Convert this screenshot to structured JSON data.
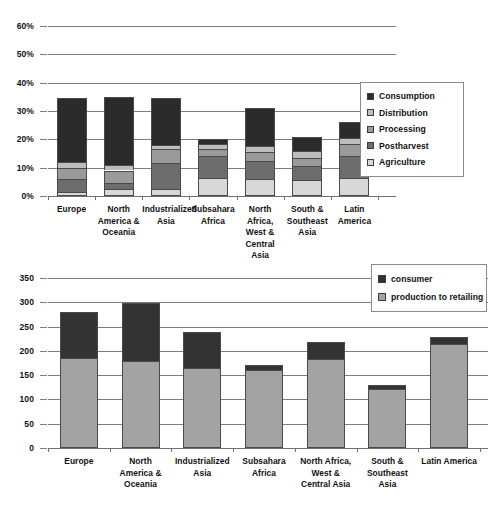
{
  "chart_data": [
    {
      "type": "bar",
      "stacked": true,
      "title": "",
      "xlabel": "",
      "ylabel": "",
      "ylim": [
        0,
        60
      ],
      "ytick_labels": [
        "0%",
        "10%",
        "20%",
        "30%",
        "40%",
        "50%",
        "60%"
      ],
      "ytick_values": [
        0,
        10,
        20,
        30,
        40,
        50,
        60
      ],
      "grid": true,
      "legend_position": "right",
      "categories": [
        "Europe",
        "North America & Oceania",
        "Industrialized Asia",
        "Subsahara Africa",
        "North Africa, West & Central Asia",
        "South & Southeast Asia",
        "Latin America"
      ],
      "category_lines": [
        [
          "Europe"
        ],
        [
          "North",
          "America &",
          "Oceania"
        ],
        [
          "Industrialized",
          "Asia"
        ],
        [
          "Subsahara",
          "Africa"
        ],
        [
          "North Africa,",
          "West &",
          "Central Asia"
        ],
        [
          "South &",
          "Southeast",
          "Asia"
        ],
        [
          "Latin",
          "America"
        ]
      ],
      "series": [
        {
          "name": "Agriculture",
          "color": "#d8d8d8",
          "values": [
            1.5,
            2.5,
            2.5,
            6.5,
            6.0,
            5.5,
            6.5
          ]
        },
        {
          "name": "Postharvest",
          "color": "#6d6d6d",
          "values": [
            4.5,
            2.0,
            9.0,
            7.5,
            6.5,
            5.0,
            7.5
          ]
        },
        {
          "name": "Processing",
          "color": "#9a9a9a",
          "values": [
            4.0,
            4.5,
            5.0,
            2.5,
            3.0,
            3.0,
            4.5
          ]
        },
        {
          "name": "Distribution",
          "color": "#bdbdbd",
          "values": [
            2.0,
            2.0,
            1.5,
            2.0,
            2.0,
            2.5,
            2.0
          ]
        },
        {
          "name": "Consumption",
          "color": "#2b2b2b",
          "values": [
            22.5,
            24.0,
            16.5,
            1.5,
            13.5,
            5.0,
            5.5
          ]
        }
      ],
      "totals": [
        34.5,
        35.0,
        34.5,
        20.0,
        31.0,
        21.0,
        26.0
      ],
      "legend_order_top_down": [
        "Consumption",
        "Distribution",
        "Processing",
        "Postharvest",
        "Agriculture"
      ]
    },
    {
      "type": "bar",
      "stacked": true,
      "title": "",
      "xlabel": "",
      "ylabel": "",
      "ylim": [
        0,
        350
      ],
      "ytick_labels": [
        "0",
        "50",
        "100",
        "150",
        "200",
        "250",
        "300",
        "350"
      ],
      "ytick_values": [
        0,
        50,
        100,
        150,
        200,
        250,
        300,
        350
      ],
      "grid": true,
      "legend_position": "top-right",
      "categories": [
        "Europe",
        "North America & Oceania",
        "Industrialized Asia",
        "Subsahara Africa",
        "North Africa, West & Central Asia",
        "South & Southeast Asia",
        "Latin America"
      ],
      "category_lines": [
        [
          "Europe"
        ],
        [
          "North",
          "America &",
          "Oceania"
        ],
        [
          "Industrialized",
          "Asia"
        ],
        [
          "Subsahara",
          "Africa"
        ],
        [
          "North Africa,",
          "West &",
          "Central Asia"
        ],
        [
          "South &",
          "Southeast",
          "Asia"
        ],
        [
          "Latin America"
        ]
      ],
      "series": [
        {
          "name": "production to retailing",
          "color": "#a3a3a3",
          "values": [
            185,
            180,
            165,
            160,
            183,
            122,
            215
          ]
        },
        {
          "name": "consumer",
          "color": "#333333",
          "values": [
            95,
            118,
            73,
            10,
            35,
            8,
            13
          ]
        }
      ],
      "totals": [
        280,
        298,
        238,
        170,
        218,
        130,
        228
      ],
      "legend_order_top_down": [
        "consumer",
        "production to retailing"
      ]
    }
  ],
  "legends": {
    "chart1": [
      {
        "label": "Consumption",
        "color": "#2b2b2b"
      },
      {
        "label": "Distribution",
        "color": "#bdbdbd"
      },
      {
        "label": "Processing",
        "color": "#9a9a9a"
      },
      {
        "label": "Postharvest",
        "color": "#6d6d6d"
      },
      {
        "label": "Agriculture",
        "color": "#d8d8d8"
      }
    ],
    "chart2": [
      {
        "label": "consumer",
        "color": "#333333"
      },
      {
        "label": "production to retailing",
        "color": "#a3a3a3"
      }
    ]
  }
}
